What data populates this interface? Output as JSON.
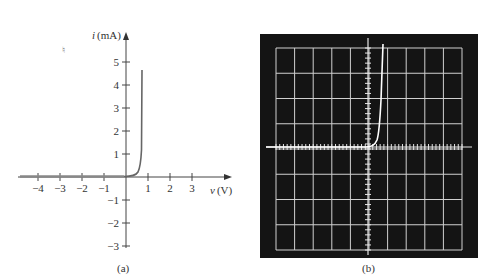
{
  "chart_data": [
    {
      "panel": "a",
      "type": "line",
      "caption": "(a)",
      "title": "",
      "xlabel": "v (V)",
      "ylabel": "i (mA)",
      "xlabel_italic": "v",
      "xlabel_unit": "(V)",
      "ylabel_italic": "i",
      "ylabel_unit": "(mA)",
      "xlim": [
        -4.5,
        4.5
      ],
      "ylim": [
        -3.5,
        5.8
      ],
      "x_ticks": [
        -4,
        -3,
        -2,
        -1,
        1,
        2,
        3
      ],
      "x_tick_labels": [
        "−4",
        "−3",
        "−2",
        "−1",
        "1",
        "2",
        "3"
      ],
      "y_ticks": [
        5,
        4,
        3,
        2,
        1,
        -1,
        -2,
        -3
      ],
      "y_tick_labels": [
        "5",
        "4",
        "3",
        "2",
        "1",
        "−1",
        "−2",
        "−3"
      ],
      "grid": false,
      "series": [
        {
          "name": "diode i-v characteristic",
          "x": [
            -4.5,
            -1,
            0,
            0.3,
            0.5,
            0.6,
            0.65,
            0.7,
            0.72,
            0.75
          ],
          "y": [
            0,
            0,
            0,
            0.05,
            0.3,
            0.8,
            1.5,
            2.6,
            3.4,
            4.7
          ]
        }
      ],
      "colors": {
        "curve": "#666666",
        "axes": "#333333"
      }
    },
    {
      "panel": "b",
      "type": "line",
      "caption": "(b)",
      "description": "Oscilloscope display of diode characteristic",
      "grid": true,
      "grid_divisions": {
        "horizontal": 10,
        "vertical": 8
      },
      "series": [
        {
          "name": "scope trace",
          "shape": "exponential knee just right of origin, flat to the left"
        }
      ],
      "colors": {
        "screen": "#111111",
        "grid": "#d8d8d8",
        "trace": "#ffffff"
      }
    }
  ]
}
